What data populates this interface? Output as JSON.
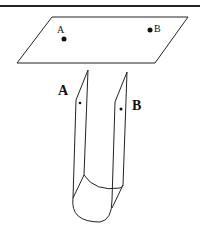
{
  "diagram": {
    "top_rule": true,
    "plane": {
      "points": [
        {
          "label": "A",
          "x": 64,
          "y": 39
        },
        {
          "label": "B",
          "x": 150,
          "y": 30
        }
      ]
    },
    "strip": {
      "labels": [
        {
          "text": "A",
          "x": 58,
          "y": 95
        },
        {
          "text": "B",
          "x": 132,
          "y": 108
        }
      ]
    },
    "colors": {
      "stroke": "#222222",
      "background": "#ffffff"
    }
  }
}
